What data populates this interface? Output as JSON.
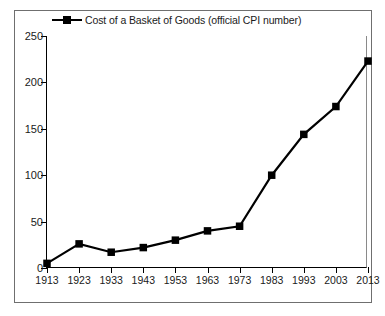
{
  "chart_data": {
    "type": "line",
    "title": "",
    "subtitle": "",
    "xlabel": "",
    "ylabel": "",
    "legend_position": "top-left",
    "grid": false,
    "xlim": [
      1913,
      2013
    ],
    "ylim": [
      0,
      250
    ],
    "yticks": [
      0,
      50,
      100,
      150,
      200,
      250
    ],
    "categories": [
      "1913",
      "1923",
      "1933",
      "1943",
      "1953",
      "1963",
      "1973",
      "1983",
      "1993",
      "2003",
      "2013"
    ],
    "x": [
      1913,
      1923,
      1933,
      1943,
      1953,
      1963,
      1973,
      1983,
      1993,
      2003,
      2013
    ],
    "series": [
      {
        "name": "Cost of a Basket of Goods (official CPI number)",
        "marker": "square",
        "color": "#000000",
        "values": [
          5,
          26,
          17,
          22,
          30,
          40,
          45,
          100,
          144,
          174,
          223
        ]
      }
    ]
  },
  "legend": {
    "entries": [
      {
        "label": "Cost of a Basket of Goods (official CPI number)",
        "color": "#000000",
        "marker": "square"
      }
    ]
  },
  "axes": {
    "y_tick_labels": [
      "250",
      "200",
      "150",
      "100",
      "50",
      "0"
    ],
    "x_tick_labels": [
      "1913",
      "1923",
      "1933",
      "1943",
      "1953",
      "1963",
      "1973",
      "1983",
      "1993",
      "2003",
      "2013"
    ]
  },
  "colors": {
    "line": "#000000",
    "marker": "#000000",
    "axis": "#000000",
    "frame": "#6f6f6f",
    "background": "#ffffff",
    "text": "#1a1a1a"
  }
}
